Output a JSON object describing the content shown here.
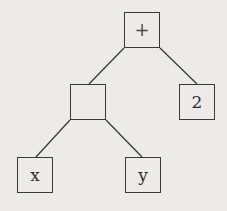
{
  "diagram": {
    "type": "expression-tree",
    "colors": {
      "background": "#ecebe8",
      "line": "#3a3a3a",
      "text": "#2e2e2e"
    },
    "nodes": [
      {
        "id": "root",
        "label": "+",
        "x": 124,
        "y": 12,
        "w": 36,
        "h": 36
      },
      {
        "id": "inner",
        "label": "",
        "x": 70,
        "y": 84,
        "w": 36,
        "h": 36
      },
      {
        "id": "two",
        "label": "2",
        "x": 179,
        "y": 84,
        "w": 36,
        "h": 36
      },
      {
        "id": "x",
        "label": "x",
        "x": 17,
        "y": 157,
        "w": 36,
        "h": 36
      },
      {
        "id": "y",
        "label": "y",
        "x": 125,
        "y": 157,
        "w": 36,
        "h": 36
      }
    ],
    "edges": [
      {
        "from": "root",
        "to": "inner",
        "x1": 124,
        "y1": 48,
        "x2": 89,
        "y2": 84
      },
      {
        "from": "root",
        "to": "two",
        "x1": 160,
        "y1": 48,
        "x2": 197,
        "y2": 84
      },
      {
        "from": "inner",
        "to": "x",
        "x1": 70,
        "y1": 120,
        "x2": 36,
        "y2": 157
      },
      {
        "from": "inner",
        "to": "y",
        "x1": 106,
        "y1": 120,
        "x2": 142,
        "y2": 157
      }
    ]
  }
}
